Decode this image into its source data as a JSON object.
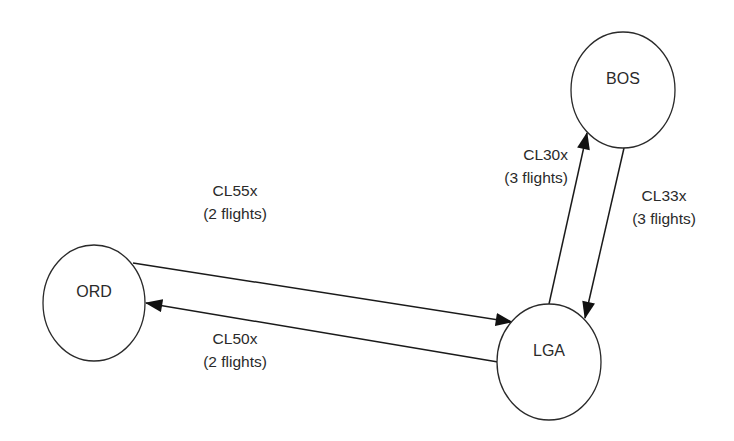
{
  "diagram": {
    "type": "flight-network",
    "nodes": [
      {
        "id": "BOS",
        "label": "BOS"
      },
      {
        "id": "ORD",
        "label": "ORD"
      },
      {
        "id": "LGA",
        "label": "LGA"
      }
    ],
    "edges": [
      {
        "id": "cl55x",
        "from": "ORD",
        "to": "LGA",
        "route": "CL55x",
        "flights": "(2 flights)"
      },
      {
        "id": "cl50x",
        "from": "LGA",
        "to": "ORD",
        "route": "CL50x",
        "flights": "(2 flights)"
      },
      {
        "id": "cl30x",
        "from": "LGA",
        "to": "BOS",
        "route": "CL30x",
        "flights": "(3 flights)"
      },
      {
        "id": "cl33x",
        "from": "BOS",
        "to": "LGA",
        "route": "CL33x",
        "flights": "(3 flights)"
      }
    ]
  }
}
